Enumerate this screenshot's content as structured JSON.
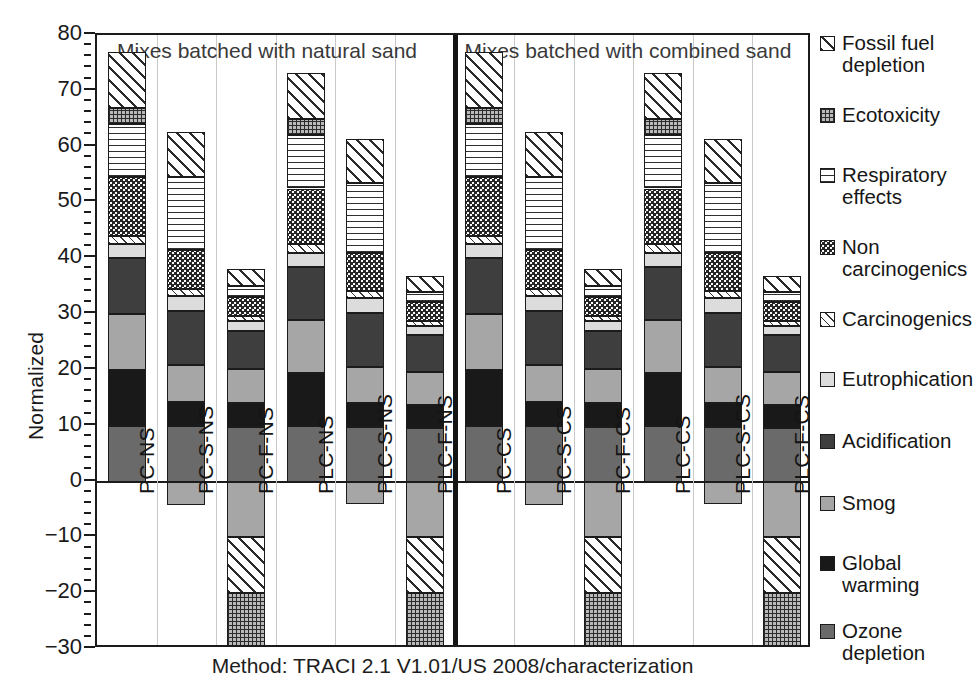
{
  "chart_data": {
    "type": "bar",
    "subtype": "stacked-bar-with-negatives",
    "title": "",
    "caption": "Method: TRACI 2.1 V1.01/US 2008/characterization",
    "ylabel": "Normalized",
    "xlabel": "",
    "ylim": [
      -30,
      80
    ],
    "ytick_labels": [
      "80",
      "70",
      "60",
      "50",
      "40",
      "30",
      "20",
      "10",
      "0",
      "-10",
      "-20",
      "-30"
    ],
    "ytick_values": [
      80,
      70,
      60,
      50,
      40,
      30,
      20,
      10,
      0,
      -10,
      -20,
      -30
    ],
    "yminor_step": 2,
    "grid": false,
    "legend_position": "right",
    "group_titles": [
      "Mixes batched with natural sand",
      "Mixes batched with combined sand"
    ],
    "categories": [
      "PC-NS",
      "PC-S-NS",
      "PC-F-NS",
      "PLC-NS",
      "PLC-S-NS",
      "PLC-F-NS",
      "PC-CS",
      "PC-S-CS",
      "PC-F-CS",
      "PLC-CS",
      "PLC-S-CS",
      "PLC-F-CS"
    ],
    "series": [
      {
        "name": "Ozone depletion",
        "key": "ozone",
        "values": [
          10.0,
          9.9,
          9.7,
          9.9,
          9.8,
          9.6,
          10.0,
          9.9,
          9.7,
          9.9,
          9.8,
          9.6
        ]
      },
      {
        "name": "Global warming",
        "key": "global",
        "values": [
          10.0,
          4.3,
          4.3,
          9.5,
          4.3,
          4.1,
          10.0,
          4.3,
          4.3,
          9.5,
          4.3,
          4.1
        ]
      },
      {
        "name": "Smog",
        "key": "smog",
        "values": [
          10.0,
          6.6,
          6.2,
          9.5,
          6.5,
          6.0,
          10.0,
          6.6,
          6.2,
          9.5,
          6.5,
          6.0
        ]
      },
      {
        "name": "Acidification",
        "key": "acid",
        "values": [
          10.0,
          9.7,
          6.8,
          9.6,
          9.6,
          6.6,
          10.0,
          9.7,
          6.8,
          9.6,
          9.6,
          6.6
        ]
      },
      {
        "name": "Eutrophication",
        "key": "eutro",
        "values": [
          2.5,
          2.8,
          1.8,
          2.5,
          2.7,
          1.6,
          2.5,
          2.8,
          1.8,
          2.5,
          2.7,
          1.6
        ]
      },
      {
        "name": "Carcinogenics",
        "key": "carc",
        "values": [
          1.5,
          1.2,
          0.8,
          1.5,
          1.2,
          0.8,
          1.5,
          1.2,
          0.8,
          1.5,
          1.2,
          0.8
        ]
      },
      {
        "name": "Non carcinogenics",
        "key": "noncarc",
        "values": [
          10.5,
          7.0,
          3.4,
          10.0,
          6.8,
          3.4,
          10.5,
          7.0,
          3.4,
          10.0,
          6.8,
          3.4
        ]
      },
      {
        "name": "Respiratory effects",
        "key": "resp",
        "values": [
          9.5,
          13.0,
          2.0,
          9.5,
          12.5,
          1.9,
          9.5,
          13.0,
          2.0,
          9.5,
          12.5,
          1.9
        ]
      },
      {
        "name": "Ecotoxicity",
        "key": "eco",
        "values": [
          3.0,
          0.0,
          0.0,
          2.9,
          0.0,
          0.0,
          3.0,
          0.0,
          0.0,
          2.9,
          0.0,
          0.0
        ]
      },
      {
        "name": "Fossil fuel depletion",
        "key": "fossil",
        "values": [
          10.0,
          8.2,
          3.0,
          8.3,
          8.0,
          2.8,
          10.0,
          8.2,
          3.0,
          8.3,
          8.0,
          2.8
        ]
      }
    ],
    "negative_series": [
      {
        "name": "Smog",
        "key": "smog",
        "values": [
          0.0,
          -4.2,
          -10.0,
          0.0,
          -4.1,
          -10.0,
          0.0,
          -4.2,
          -10.0,
          0.0,
          -4.1,
          -10.0
        ]
      },
      {
        "name": "Fossil fuel depletion",
        "key": "fossil",
        "values": [
          0.0,
          0.0,
          -10.0,
          0.0,
          0.0,
          -10.0,
          0.0,
          0.0,
          -10.0,
          0.0,
          0.0,
          -10.0
        ]
      },
      {
        "name": "Ecotoxicity",
        "key": "eco",
        "values": [
          0.0,
          0.0,
          -9.7,
          0.0,
          0.0,
          -9.6,
          0.0,
          0.0,
          -9.7,
          0.0,
          0.0,
          -9.6
        ]
      }
    ],
    "positive_totals": [
      77.0,
      62.7,
      38.0,
      73.2,
      61.4,
      36.8,
      77.0,
      62.7,
      38.0,
      73.2,
      61.4,
      36.8
    ],
    "negative_totals": [
      0.0,
      -4.2,
      -29.7,
      0.0,
      -4.1,
      -29.6,
      0.0,
      -4.2,
      -29.7,
      0.0,
      -4.1,
      -29.6
    ]
  },
  "legend": {
    "items": [
      {
        "label": "Fossil fuel depletion",
        "pattern": "fossil",
        "top": 8
      },
      {
        "label": "Ecotoxicity",
        "pattern": "eco",
        "top": 80
      },
      {
        "label": "Respiratory effects",
        "pattern": "resp",
        "top": 140
      },
      {
        "label": "Non carcinogenics",
        "pattern": "noncarc",
        "top": 212
      },
      {
        "label": "Carcinogenics",
        "pattern": "carc",
        "top": 284
      },
      {
        "label": "Eutrophication",
        "pattern": "eutro",
        "top": 344
      },
      {
        "label": "Acidification",
        "pattern": "acid",
        "top": 406
      },
      {
        "label": "Smog",
        "pattern": "smog",
        "top": 468
      },
      {
        "label": "Global warming",
        "pattern": "global",
        "top": 528
      },
      {
        "label": "Ozone depletion",
        "pattern": "ozone",
        "top": 596
      }
    ]
  }
}
